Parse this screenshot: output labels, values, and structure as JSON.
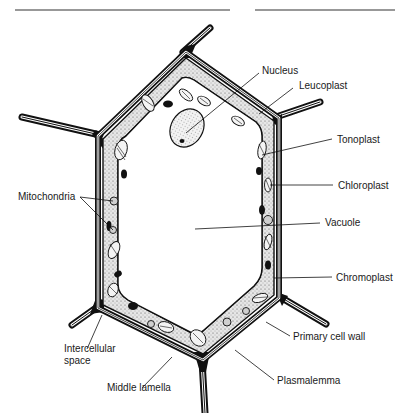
{
  "figure": {
    "labels": {
      "nucleus": "Nucleus",
      "leucoplast": "Leucoplast",
      "tonoplast": "Tonoplast",
      "chloroplast": "Chloroplast",
      "vacuole": "Vacuole",
      "chromoplast": "Chromoplast",
      "primary_cell_wall": "Primary cell wall",
      "plasmalemma": "Plasmalemma",
      "middle_lamella": "Middle lamella",
      "intercellular_space_line1": "Intercellular",
      "intercellular_space_line2": "space",
      "mitochondria": "Mitochondria"
    },
    "colors": {
      "ink": "#111111",
      "cytoplasm": "#d8d8d8",
      "background": "#ffffff"
    }
  }
}
